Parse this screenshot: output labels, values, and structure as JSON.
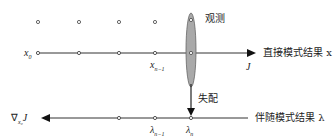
{
  "diagram": {
    "observation_label": "观测",
    "mismatch_label": "失配",
    "forward_label": "直接模式结果 x",
    "adjoint_label": "伴随模式结果 λ",
    "x0_label": "x",
    "x0_sub": "0",
    "xn1_label": "x",
    "xn1_sub": "n−1",
    "J_label": "J",
    "lambda_n1_label": "λ",
    "lambda_n1_sub": "n−1",
    "lambda_n_label": "λ",
    "lambda_n_sub": "n",
    "grad_label": "∇",
    "grad_sub": "x₀",
    "grad_J": "J",
    "colors": {
      "line": "#333333",
      "ellipse_fill": "#a9a9a9",
      "ellipse_stroke": "#555555",
      "dot": "#666666"
    }
  }
}
